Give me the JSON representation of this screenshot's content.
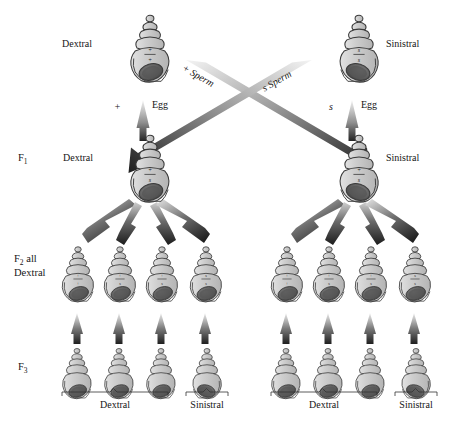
{
  "figure": {
    "organism": "snail",
    "trait": "shell chirality"
  },
  "generations": [
    {
      "id": "P",
      "label": "",
      "label_line2": ""
    },
    {
      "id": "F1",
      "label": "F",
      "sub": "1",
      "label_line2": ""
    },
    {
      "id": "F2",
      "label": "F",
      "sub": "2",
      "suffix": " all",
      "label_line2": "Dextral"
    },
    {
      "id": "F3",
      "label": "F",
      "sub": "3",
      "label_line2": ""
    }
  ],
  "parents": {
    "left": {
      "phenotype": "Dextral",
      "genotype_top": "+",
      "genotype_bottom": "+",
      "chirality": "dextral"
    },
    "right": {
      "phenotype": "Sinistral",
      "genotype_top": "s",
      "genotype_bottom": "s",
      "chirality": "sinistral"
    }
  },
  "gametes": {
    "left_egg": {
      "allele": "+",
      "label": "Egg"
    },
    "right_egg": {
      "allele": "s",
      "label": "Egg"
    },
    "left_sperm": {
      "allele": "+",
      "label": "Sperm"
    },
    "right_sperm": {
      "allele": "s",
      "label": "Sperm"
    }
  },
  "f1": {
    "left": {
      "phenotype": "Dextral",
      "genotype_top": "+",
      "genotype_bottom": "s",
      "chirality": "dextral"
    },
    "right": {
      "phenotype": "Sinistral",
      "genotype_top": "+",
      "genotype_bottom": "s",
      "chirality": "sinistral"
    }
  },
  "f2": {
    "note": "F2 all Dextral",
    "left_group": [
      {
        "genotype_top": "+",
        "genotype_bottom": "+",
        "chirality": "dextral"
      },
      {
        "genotype_top": "+",
        "genotype_bottom": "s",
        "chirality": "dextral"
      },
      {
        "genotype_top": "+",
        "genotype_bottom": "s",
        "chirality": "dextral"
      },
      {
        "genotype_top": "s",
        "genotype_bottom": "s",
        "chirality": "dextral"
      }
    ],
    "right_group": [
      {
        "genotype_top": "+",
        "genotype_bottom": "+",
        "chirality": "dextral"
      },
      {
        "genotype_top": "+",
        "genotype_bottom": "s",
        "chirality": "dextral"
      },
      {
        "genotype_top": "+",
        "genotype_bottom": "s",
        "chirality": "dextral"
      },
      {
        "genotype_top": "s",
        "genotype_bottom": "s",
        "chirality": "dextral"
      }
    ]
  },
  "f3": {
    "left_group": [
      {
        "chirality": "dextral"
      },
      {
        "chirality": "dextral"
      },
      {
        "chirality": "dextral"
      },
      {
        "chirality": "sinistral"
      }
    ],
    "right_group": [
      {
        "chirality": "dextral"
      },
      {
        "chirality": "dextral"
      },
      {
        "chirality": "dextral"
      },
      {
        "chirality": "sinistral"
      }
    ]
  },
  "brackets": {
    "left_dextral": "Dextral",
    "left_sinistral": "Sinistral",
    "right_dextral": "Dextral",
    "right_sinistral": "Sinistral"
  },
  "colors": {
    "shell_fill": "#c9c9c9",
    "shell_fill_light": "#d8d8d8",
    "shell_outline": "#3a3a3a",
    "aperture_dark": "#5d5d5d",
    "arrow_dark": "#2b2b2b",
    "arrow_light": "#e8e8e8",
    "text": "#151515",
    "background": "#ffffff"
  }
}
